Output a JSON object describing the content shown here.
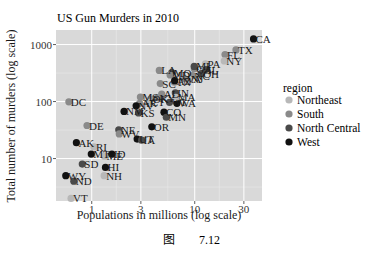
{
  "chart_data": {
    "type": "scatter",
    "title": "US Gun Murders in 2010",
    "xlabel": "Populations in millions (log scale)",
    "ylabel": "Total number of murders (log scale)",
    "x_scale": "log10",
    "y_scale": "log10",
    "xticks": [
      1,
      3,
      10,
      30
    ],
    "yticks": [
      10,
      100,
      1000
    ],
    "xlim": [
      0.45,
      45
    ],
    "ylim": [
      1.8,
      1800
    ],
    "grid": true,
    "background": "#d9d9d9",
    "legend": {
      "title": "region",
      "position": "right",
      "entries": [
        {
          "name": "Northeast",
          "color": "#b8b8b8"
        },
        {
          "name": "South",
          "color": "#8a8a8a"
        },
        {
          "name": "North Central",
          "color": "#4a4a4a"
        },
        {
          "name": "West",
          "color": "#111111"
        }
      ]
    },
    "points": [
      {
        "label": "CA",
        "x": 37.25,
        "y": 1257,
        "region": "West"
      },
      {
        "label": "TX",
        "x": 25.15,
        "y": 805,
        "region": "South"
      },
      {
        "label": "FL",
        "x": 19.69,
        "y": 669,
        "region": "South"
      },
      {
        "label": "NY",
        "x": 19.38,
        "y": 517,
        "region": "Northeast"
      },
      {
        "label": "PA",
        "x": 12.7,
        "y": 457,
        "region": "Northeast"
      },
      {
        "label": "IL",
        "x": 12.83,
        "y": 364,
        "region": "North Central"
      },
      {
        "label": "GA",
        "x": 9.92,
        "y": 376,
        "region": "South"
      },
      {
        "label": "MI",
        "x": 9.88,
        "y": 413,
        "region": "North Central"
      },
      {
        "label": "OH",
        "x": 11.54,
        "y": 310,
        "region": "North Central"
      },
      {
        "label": "NC",
        "x": 9.54,
        "y": 286,
        "region": "South"
      },
      {
        "label": "LA",
        "x": 4.53,
        "y": 351,
        "region": "South"
      },
      {
        "label": "MO",
        "x": 5.99,
        "y": 321,
        "region": "North Central"
      },
      {
        "label": "MD",
        "x": 5.77,
        "y": 293,
        "region": "South"
      },
      {
        "label": "SC",
        "x": 4.63,
        "y": 207,
        "region": "South"
      },
      {
        "label": "TN",
        "x": 6.35,
        "y": 219,
        "region": "South"
      },
      {
        "label": "NJ",
        "x": 8.79,
        "y": 246,
        "region": "Northeast"
      },
      {
        "label": "VA",
        "x": 8.0,
        "y": 250,
        "region": "South"
      },
      {
        "label": "AL",
        "x": 4.78,
        "y": 135,
        "region": "South"
      },
      {
        "label": "IN",
        "x": 6.48,
        "y": 142,
        "region": "North Central"
      },
      {
        "label": "AZ",
        "x": 6.39,
        "y": 232,
        "region": "West"
      },
      {
        "label": "KY",
        "x": 4.34,
        "y": 116,
        "region": "South"
      },
      {
        "label": "AR",
        "x": 2.92,
        "y": 93,
        "region": "South"
      },
      {
        "label": "OK",
        "x": 3.75,
        "y": 111,
        "region": "South"
      },
      {
        "label": "MS",
        "x": 2.97,
        "y": 120,
        "region": "South"
      },
      {
        "label": "WA",
        "x": 6.72,
        "y": 93,
        "region": "West"
      },
      {
        "label": "MA",
        "x": 6.55,
        "y": 118,
        "region": "Northeast"
      },
      {
        "label": "WI",
        "x": 5.69,
        "y": 97,
        "region": "North Central"
      },
      {
        "label": "NV",
        "x": 2.7,
        "y": 84,
        "region": "West"
      },
      {
        "label": "NM",
        "x": 2.06,
        "y": 67,
        "region": "West"
      },
      {
        "label": "CO",
        "x": 5.03,
        "y": 65,
        "region": "West"
      },
      {
        "label": "MN",
        "x": 5.3,
        "y": 53,
        "region": "North Central"
      },
      {
        "label": "CT",
        "x": 3.57,
        "y": 97,
        "region": "Northeast"
      },
      {
        "label": "KS",
        "x": 2.85,
        "y": 63,
        "region": "North Central"
      },
      {
        "label": "DC",
        "x": 0.6,
        "y": 99,
        "region": "South"
      },
      {
        "label": "DE",
        "x": 0.9,
        "y": 38,
        "region": "South"
      },
      {
        "label": "OR",
        "x": 3.83,
        "y": 36,
        "region": "West"
      },
      {
        "label": "NE",
        "x": 1.83,
        "y": 32,
        "region": "North Central"
      },
      {
        "label": "WV",
        "x": 1.85,
        "y": 27,
        "region": "South"
      },
      {
        "label": "UT",
        "x": 2.76,
        "y": 22,
        "region": "West"
      },
      {
        "label": "IA",
        "x": 3.05,
        "y": 21,
        "region": "North Central"
      },
      {
        "label": "AK",
        "x": 0.71,
        "y": 19,
        "region": "West"
      },
      {
        "label": "RI",
        "x": 1.05,
        "y": 16,
        "region": "Northeast"
      },
      {
        "label": "MT",
        "x": 0.99,
        "y": 12,
        "region": "West"
      },
      {
        "label": "ID",
        "x": 1.57,
        "y": 12,
        "region": "West"
      },
      {
        "label": "ME",
        "x": 1.33,
        "y": 11,
        "region": "Northeast"
      },
      {
        "label": "SD",
        "x": 0.81,
        "y": 8,
        "region": "North Central"
      },
      {
        "label": "HI",
        "x": 1.36,
        "y": 7,
        "region": "West"
      },
      {
        "label": "NH",
        "x": 1.32,
        "y": 5,
        "region": "Northeast"
      },
      {
        "label": "WY",
        "x": 0.56,
        "y": 5,
        "region": "West"
      },
      {
        "label": "ND",
        "x": 0.67,
        "y": 4,
        "region": "North Central"
      },
      {
        "label": "VT",
        "x": 0.63,
        "y": 2,
        "region": "Northeast"
      }
    ]
  },
  "caption": {
    "prefix": "图",
    "number": "7.12"
  }
}
